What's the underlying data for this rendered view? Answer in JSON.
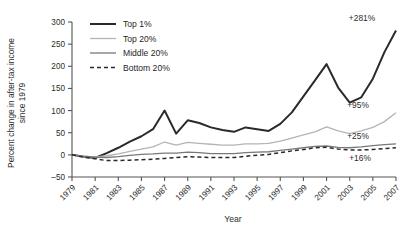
{
  "chart_data": {
    "type": "line",
    "title": "",
    "xlabel": "Year",
    "ylabel": "Percent change in after-tax income since 1979",
    "ylabel_line1": "Percent change in after-tax income",
    "ylabel_line2": "since 1979",
    "xlim": [
      1979,
      2007
    ],
    "ylim": [
      -50,
      300
    ],
    "ytick_values": [
      -50,
      0,
      50,
      100,
      150,
      200,
      250,
      300
    ],
    "ytick_labels": [
      "–50",
      "0",
      "50",
      "100",
      "150",
      "200",
      "250",
      "300"
    ],
    "xtick_values": [
      1979,
      1981,
      1983,
      1985,
      1987,
      1989,
      1991,
      1993,
      1995,
      1997,
      1999,
      2001,
      2003,
      2005,
      2007
    ],
    "xtick_labels": [
      "1979",
      "1981",
      "1983",
      "1985",
      "1987",
      "1989",
      "1991",
      "1993",
      "1995",
      "1997",
      "1999",
      "2001",
      "2003",
      "2005",
      "2007"
    ],
    "grid": false,
    "legend_position": "top-left",
    "x": [
      1979,
      1980,
      1981,
      1982,
      1983,
      1984,
      1985,
      1986,
      1987,
      1988,
      1989,
      1990,
      1991,
      1992,
      1993,
      1994,
      1995,
      1996,
      1997,
      1998,
      1999,
      2000,
      2001,
      2002,
      2003,
      2004,
      2005,
      2006,
      2007
    ],
    "series": [
      {
        "name": "Top 1%",
        "color": "#2a2a2a",
        "width": 2.0,
        "dash": "none",
        "end_annotation": "+281%",
        "values": [
          0,
          -4,
          -7,
          4,
          16,
          30,
          42,
          58,
          100,
          48,
          78,
          72,
          62,
          56,
          52,
          62,
          58,
          54,
          70,
          96,
          132,
          168,
          205,
          152,
          118,
          130,
          172,
          232,
          281
        ]
      },
      {
        "name": "Top 20%",
        "color": "#b4b4b4",
        "width": 1.3,
        "dash": "none",
        "end_annotation": "+95%",
        "values": [
          0,
          -3,
          -5,
          -2,
          2,
          8,
          13,
          18,
          29,
          22,
          28,
          26,
          24,
          22,
          22,
          25,
          25,
          26,
          31,
          38,
          45,
          52,
          63,
          54,
          48,
          54,
          62,
          75,
          95
        ]
      },
      {
        "name": "Middle 20%",
        "color": "#787878",
        "width": 1.3,
        "dash": "none",
        "end_annotation": "+25%",
        "values": [
          0,
          -3,
          -5,
          -6,
          -4,
          -1,
          1,
          2,
          4,
          4,
          6,
          5,
          3,
          3,
          3,
          5,
          6,
          7,
          10,
          13,
          16,
          19,
          20,
          17,
          16,
          18,
          21,
          23,
          25
        ]
      },
      {
        "name": "Bottom 20%",
        "color": "#2a2a2a",
        "width": 1.5,
        "dash": "4,3",
        "end_annotation": "+16%",
        "values": [
          0,
          -5,
          -9,
          -13,
          -13,
          -12,
          -11,
          -10,
          -8,
          -6,
          -4,
          -5,
          -6,
          -6,
          -6,
          -3,
          -1,
          1,
          5,
          9,
          12,
          16,
          17,
          13,
          11,
          11,
          12,
          14,
          16
        ]
      }
    ],
    "annotations": [
      {
        "text": "+281%",
        "series": "Top 1%"
      },
      {
        "text": "+95%",
        "series": "Top 20%"
      },
      {
        "text": "+25%",
        "series": "Middle 20%"
      },
      {
        "text": "+16%",
        "series": "Bottom 20%"
      }
    ]
  },
  "legend": {
    "items": [
      {
        "label": "Top 1%"
      },
      {
        "label": "Top 20%"
      },
      {
        "label": "Middle 20%"
      },
      {
        "label": "Bottom 20%"
      }
    ]
  }
}
